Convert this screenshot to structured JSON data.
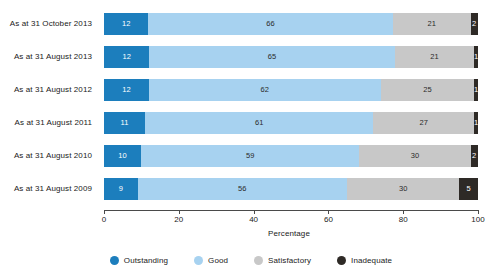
{
  "chart_data": {
    "type": "bar",
    "orientation": "horizontal",
    "stacked": true,
    "stack_mode": "percent",
    "title": "",
    "xlabel": "Percentage",
    "ylabel": "",
    "xlim": [
      0,
      100
    ],
    "xticks": [
      0,
      20,
      40,
      60,
      80,
      100
    ],
    "xtick_labels": [
      "0",
      "20",
      "40",
      "60",
      "80",
      "100"
    ],
    "grid": false,
    "legend_position": "bottom",
    "categories": [
      "As at 31 October 2013",
      "As at 31 August 2013",
      "As at 31 August 2012",
      "As at 31 August 2011",
      "As at 31 August 2010",
      "As at 31 August 2009"
    ],
    "series": [
      {
        "name": "Outstanding",
        "color": "#1c7ebd",
        "values": [
          12,
          12,
          12,
          11,
          10,
          9
        ]
      },
      {
        "name": "Good",
        "color": "#a7d2f0",
        "values": [
          66,
          65,
          62,
          61,
          59,
          56
        ]
      },
      {
        "name": "Satisfactory",
        "color": "#c8c8c8",
        "values": [
          21,
          21,
          25,
          27,
          30,
          30
        ]
      },
      {
        "name": "Inadequate",
        "color": "#2e2a26",
        "values": [
          2,
          1,
          1,
          1,
          2,
          5
        ]
      }
    ]
  },
  "legend": {
    "items": [
      {
        "label": "Outstanding",
        "color": "#1c7ebd"
      },
      {
        "label": "Good",
        "color": "#a7d2f0"
      },
      {
        "label": "Satisfactory",
        "color": "#c8c8c8"
      },
      {
        "label": "Inadequate",
        "color": "#2e2a26"
      }
    ]
  },
  "axis": {
    "x_title": "Percentage"
  }
}
